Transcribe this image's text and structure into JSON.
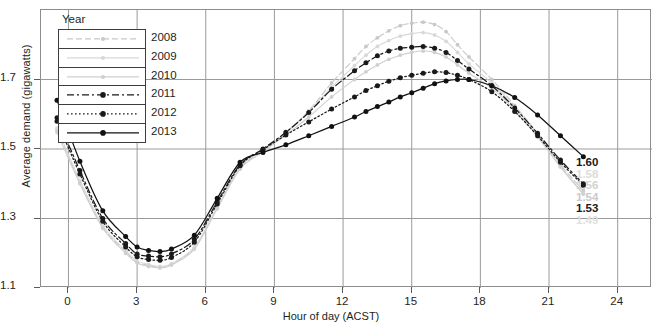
{
  "chart_data": {
    "type": "line",
    "title": "",
    "xlabel": "Hour of day (ACST)",
    "ylabel": "Average demand (gigawatts)",
    "xlim": [
      -1.2,
      25.5
    ],
    "ylim": [
      1.1,
      1.9
    ],
    "xticks": [
      0,
      3,
      6,
      9,
      12,
      15,
      18,
      21,
      24
    ],
    "yticks": [
      1.1,
      1.3,
      1.5,
      1.7
    ],
    "xtick_labels": [
      "0",
      "3",
      "6",
      "9",
      "12",
      "15",
      "18",
      "21",
      "24"
    ],
    "ytick_labels": [
      "1.1",
      "1.3",
      "1.5",
      "1.7"
    ],
    "grid": true,
    "legend_title": "Year",
    "legend_position": "inside-top-left",
    "x": [
      -0.5,
      0.5,
      1.5,
      2.5,
      3.0,
      3.5,
      4.0,
      4.5,
      5.5,
      6.5,
      7.5,
      8.5,
      9.5,
      10.5,
      11.5,
      12.5,
      13.0,
      13.5,
      14.0,
      14.5,
      15.0,
      15.5,
      16.0,
      16.5,
      17.0,
      17.5,
      18.5,
      19.5,
      20.5,
      21.5,
      22.5
    ],
    "series": [
      {
        "name": "2008",
        "color": "#c8c8c8",
        "dash": "6,3",
        "values": [
          1.555,
          1.405,
          1.275,
          1.205,
          1.175,
          1.165,
          1.16,
          1.168,
          1.215,
          1.33,
          1.445,
          1.495,
          1.545,
          1.61,
          1.69,
          1.76,
          1.795,
          1.82,
          1.84,
          1.855,
          1.862,
          1.865,
          1.858,
          1.838,
          1.8,
          1.765,
          1.7,
          1.625,
          1.545,
          1.455,
          1.38
        ]
      },
      {
        "name": "2009",
        "color": "#d8d8d8",
        "dash": "0",
        "values": [
          1.56,
          1.41,
          1.28,
          1.208,
          1.178,
          1.168,
          1.162,
          1.17,
          1.218,
          1.332,
          1.448,
          1.498,
          1.548,
          1.608,
          1.678,
          1.74,
          1.77,
          1.795,
          1.812,
          1.825,
          1.832,
          1.835,
          1.828,
          1.81,
          1.778,
          1.745,
          1.69,
          1.62,
          1.54,
          1.45,
          1.372
        ]
      },
      {
        "name": "2010",
        "color": "#cfcfcf",
        "dash": "0",
        "values": [
          1.548,
          1.4,
          1.272,
          1.2,
          1.172,
          1.162,
          1.158,
          1.166,
          1.212,
          1.328,
          1.442,
          1.492,
          1.54,
          1.592,
          1.65,
          1.7,
          1.722,
          1.742,
          1.758,
          1.77,
          1.778,
          1.782,
          1.778,
          1.765,
          1.742,
          1.718,
          1.675,
          1.612,
          1.535,
          1.448,
          1.37
        ]
      },
      {
        "name": "2011",
        "color": "#1a1a1a",
        "dash": "7,3,2,3",
        "values": [
          1.59,
          1.438,
          1.3,
          1.228,
          1.198,
          1.192,
          1.19,
          1.198,
          1.24,
          1.348,
          1.455,
          1.5,
          1.548,
          1.605,
          1.672,
          1.725,
          1.748,
          1.768,
          1.782,
          1.79,
          1.793,
          1.795,
          1.79,
          1.778,
          1.755,
          1.73,
          1.682,
          1.618,
          1.545,
          1.468,
          1.4
        ]
      },
      {
        "name": "2012",
        "color": "#1a1a1a",
        "dash": "1.6,2.4",
        "values": [
          1.58,
          1.428,
          1.292,
          1.218,
          1.19,
          1.182,
          1.18,
          1.188,
          1.232,
          1.342,
          1.452,
          1.498,
          1.54,
          1.578,
          1.615,
          1.65,
          1.668,
          1.682,
          1.695,
          1.705,
          1.712,
          1.718,
          1.722,
          1.72,
          1.712,
          1.7,
          1.665,
          1.608,
          1.538,
          1.462,
          1.395
        ]
      },
      {
        "name": "2013",
        "color": "#111111",
        "dash": "0",
        "values": [
          1.64,
          1.465,
          1.322,
          1.248,
          1.218,
          1.208,
          1.205,
          1.212,
          1.252,
          1.358,
          1.462,
          1.49,
          1.512,
          1.538,
          1.565,
          1.592,
          1.608,
          1.622,
          1.635,
          1.65,
          1.662,
          1.675,
          1.688,
          1.696,
          1.7,
          1.7,
          1.682,
          1.648,
          1.598,
          1.538,
          1.478
        ]
      }
    ],
    "annotations": [
      {
        "text": "1.60",
        "style": "strong"
      },
      {
        "text": "1.58",
        "style": "ghost1"
      },
      {
        "text": "1.56",
        "style": "ghost2"
      },
      {
        "text": "1.54",
        "style": "ghost3"
      },
      {
        "text": "1.53",
        "style": "strong"
      },
      {
        "text": "1.49",
        "style": "ghost4"
      }
    ]
  }
}
